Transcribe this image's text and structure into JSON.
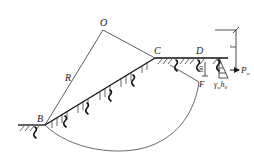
{
  "diagram": {
    "type": "slope-stability-circular-slip",
    "points": {
      "O": {
        "label": "O",
        "x": 103,
        "y": 30
      },
      "B": {
        "label": "B",
        "x": 45,
        "y": 125
      },
      "C": {
        "label": "C",
        "x": 155,
        "y": 58
      },
      "D": {
        "label": "D",
        "x": 207,
        "y": 58
      },
      "F": {
        "label": "F",
        "x": 199,
        "y": 82
      }
    },
    "labels": {
      "O": "O",
      "R": "R",
      "B": "B",
      "C": "C",
      "D": "D",
      "F": "F",
      "h0": "h0",
      "hw": "hw",
      "Pw": "P",
      "Pw_sub": "w",
      "gamma_w_h0": "γ",
      "gamma_sub": "w",
      "h0_text": "h",
      "h0_sub": "0"
    }
  }
}
